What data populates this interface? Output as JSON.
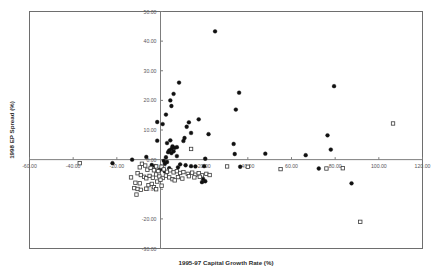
{
  "chart_data": {
    "type": "scatter",
    "title": "",
    "xlabel": "1995-97 Capital Growth Rate (%)",
    "ylabel": "1998 EP Spread (%)",
    "xlim": [
      -60,
      120
    ],
    "ylim": [
      -30,
      50
    ],
    "xticks": [
      -60,
      -40,
      -20,
      0,
      20,
      40,
      60,
      80,
      100,
      120
    ],
    "yticks": [
      -30,
      -20,
      -10,
      0,
      10,
      20,
      30,
      40,
      50
    ],
    "xticklabels": [
      "-60.00",
      "-40.00",
      "-20.00",
      "0.00",
      "20.00",
      "40.00",
      "60.00",
      "80.00",
      "100.00",
      "120.00"
    ],
    "yticklabels": [
      "-30.00",
      "-20.00",
      "-10.00",
      "0.00",
      "10.00",
      "20.00",
      "30.00",
      "40.00",
      "50.00"
    ],
    "grid": false,
    "legend": "none",
    "axis_origin_lines": true,
    "series": [
      {
        "name": "filled-diamond",
        "marker": "filled-diamond",
        "color": "#111111",
        "points": [
          [
            25.0,
            43.3
          ],
          [
            8.5,
            26.0
          ],
          [
            6.0,
            22.2
          ],
          [
            36.0,
            22.6
          ],
          [
            4.5,
            20.0
          ],
          [
            5.0,
            18.1
          ],
          [
            34.5,
            16.9
          ],
          [
            2.5,
            15.2
          ],
          [
            79.5,
            24.8
          ],
          [
            -1.5,
            12.7
          ],
          [
            1.0,
            12.0
          ],
          [
            13.0,
            12.6
          ],
          [
            17.5,
            13.6
          ],
          [
            12.0,
            11.1
          ],
          [
            76.5,
            8.2
          ],
          [
            22.0,
            8.6
          ],
          [
            14.0,
            9.0
          ],
          [
            11.0,
            7.3
          ],
          [
            10.5,
            6.3
          ],
          [
            -1.5,
            6.4
          ],
          [
            4.5,
            6.5
          ],
          [
            3.0,
            5.6
          ],
          [
            33.5,
            5.3
          ],
          [
            5.5,
            4.5
          ],
          [
            6.5,
            4.0
          ],
          [
            7.5,
            4.2
          ],
          [
            5.0,
            3.6
          ],
          [
            4.0,
            3.1
          ],
          [
            6.0,
            2.8
          ],
          [
            3.5,
            2.5
          ],
          [
            5.0,
            2.2
          ],
          [
            78.0,
            3.4
          ],
          [
            34.0,
            1.9
          ],
          [
            48.0,
            2.0
          ],
          [
            66.5,
            1.5
          ],
          [
            7.5,
            1.2
          ],
          [
            2.5,
            0.8
          ],
          [
            20.5,
            0.3
          ],
          [
            -6.5,
            0.9
          ],
          [
            -13.0,
            0.0
          ],
          [
            -22.0,
            -1.2
          ],
          [
            1.5,
            -0.4
          ],
          [
            3.0,
            -0.8
          ],
          [
            2.0,
            -1.4
          ],
          [
            9.0,
            -1.6
          ],
          [
            11.5,
            -1.9
          ],
          [
            14.0,
            -2.2
          ],
          [
            16.0,
            -2.3
          ],
          [
            20.0,
            -2.2
          ],
          [
            36.5,
            -2.4
          ],
          [
            72.5,
            -3.0
          ],
          [
            19.5,
            -6.5
          ],
          [
            20.5,
            -7.3
          ],
          [
            19.0,
            -7.6
          ],
          [
            87.5,
            -8.0
          ],
          [
            8.0,
            -2.6
          ],
          [
            4.0,
            -2.9
          ],
          [
            0.5,
            -3.1
          ],
          [
            -0.5,
            -3.5
          ],
          [
            2.0,
            -4.0
          ],
          [
            -2.5,
            -2.2
          ],
          [
            -4.0,
            -1.8
          ]
        ]
      },
      {
        "name": "open-square",
        "marker": "open-square",
        "color": "#3a3a3a",
        "points": [
          [
            106.5,
            12.2
          ],
          [
            14.0,
            3.6
          ],
          [
            -37.0,
            -1.2
          ],
          [
            30.5,
            -2.3
          ],
          [
            40.0,
            -2.4
          ],
          [
            55.0,
            -3.2
          ],
          [
            76.0,
            -3.0
          ],
          [
            83.5,
            -2.9
          ],
          [
            91.5,
            -21.0
          ],
          [
            -8.5,
            -1.4
          ],
          [
            -7.0,
            -2.0
          ],
          [
            -9.5,
            -2.6
          ],
          [
            -6.0,
            -3.4
          ],
          [
            -4.5,
            -2.8
          ],
          [
            -2.0,
            -2.3
          ],
          [
            -3.0,
            -3.6
          ],
          [
            -1.0,
            -3.9
          ],
          [
            0.5,
            -2.4
          ],
          [
            1.5,
            -3.3
          ],
          [
            3.0,
            -4.1
          ],
          [
            4.5,
            -3.6
          ],
          [
            6.0,
            -4.3
          ],
          [
            7.5,
            -3.9
          ],
          [
            9.0,
            -4.5
          ],
          [
            10.5,
            -4.2
          ],
          [
            12.5,
            -4.8
          ],
          [
            14.5,
            -4.4
          ],
          [
            16.0,
            -5.1
          ],
          [
            17.5,
            -4.6
          ],
          [
            19.0,
            -5.3
          ],
          [
            21.0,
            -4.8
          ],
          [
            22.5,
            -5.2
          ],
          [
            -10.5,
            -4.6
          ],
          [
            -9.0,
            -5.2
          ],
          [
            -7.5,
            -5.8
          ],
          [
            -6.5,
            -6.3
          ],
          [
            -5.0,
            -5.5
          ],
          [
            -3.5,
            -6.1
          ],
          [
            -2.0,
            -5.0
          ],
          [
            -0.5,
            -5.7
          ],
          [
            1.0,
            -6.2
          ],
          [
            2.5,
            -5.4
          ],
          [
            4.0,
            -6.0
          ],
          [
            5.5,
            -6.6
          ],
          [
            -11.5,
            -7.8
          ],
          [
            -9.5,
            -8.0
          ],
          [
            -12.0,
            -9.6
          ],
          [
            -10.5,
            -9.9
          ],
          [
            -9.0,
            -10.2
          ],
          [
            -11.0,
            -11.8
          ],
          [
            -6.5,
            -9.8
          ],
          [
            -5.5,
            -8.6
          ],
          [
            -4.0,
            -8.2
          ],
          [
            -1.5,
            -7.4
          ],
          [
            0.5,
            -8.8
          ],
          [
            8.0,
            -5.9
          ],
          [
            10.0,
            -6.4
          ],
          [
            13.0,
            -5.6
          ],
          [
            15.5,
            -6.0
          ],
          [
            18.0,
            -5.8
          ],
          [
            -3.0,
            -9.3
          ],
          [
            -2.0,
            -10.0
          ],
          [
            -13.5,
            -6.0
          ],
          [
            0.0,
            -6.8
          ],
          [
            6.5,
            -7.0
          ]
        ]
      }
    ]
  }
}
